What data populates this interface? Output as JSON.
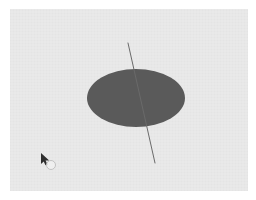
{
  "app": {
    "title": "3D Disc Viewport",
    "background_color": "#ffffff"
  },
  "canvas": {
    "name": "render-canvas",
    "background_color": "#e9e9e9",
    "x": 10,
    "y": 9,
    "width": 238,
    "height": 182
  },
  "scene": {
    "disc": {
      "label": "disc",
      "fill_color": "#5a5a5a",
      "center_x": 136,
      "center_y": 98,
      "radius_x": 49,
      "radius_y": 29
    },
    "axis_line": {
      "label": "axis",
      "stroke_color": "#6a6a6a",
      "stroke_width": 1,
      "x1": 128,
      "y1": 43,
      "x2": 155,
      "y2": 163
    }
  },
  "cursor": {
    "label": "mouse-pointer",
    "x": 41,
    "y": 153,
    "arrow_color": "#2e2e2e",
    "ring_color": "#c2c2c2"
  }
}
